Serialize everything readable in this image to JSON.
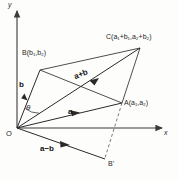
{
  "figure": {
    "background_color": "#fdfdfc",
    "stroke_color": "#3a3a3a",
    "axes": {
      "x_label": "x",
      "y_label": "y",
      "origin_label": "O"
    },
    "points": [
      {
        "id": "A",
        "label": "A(a",
        "sub1": "1",
        "mid": ",a",
        "sub2": "2",
        "tail": ")",
        "x": 122,
        "y": 103
      },
      {
        "id": "B",
        "label": "B(b",
        "sub1": "1",
        "mid": ",b",
        "sub2": "2",
        "tail": ")",
        "x": 40,
        "y": 70
      },
      {
        "id": "C",
        "label": "C(a",
        "sub1": "1",
        "mid": "+b",
        "sub2": "1",
        "tail": ")",
        "x": 140,
        "y": 48
      },
      {
        "id": "Bprime",
        "label": "B'",
        "x": 105,
        "y": 160
      }
    ],
    "point_labels": {
      "A": "A(a₁,a₂)",
      "B": "B(b₁,b₂)",
      "C": "C(a₁+b₁,a₂+b₂)",
      "Bprime": "B'"
    },
    "vectors": [
      {
        "name": "a",
        "label": "a",
        "from": "O",
        "to": "A",
        "style": "solid"
      },
      {
        "name": "b",
        "label": "b",
        "from": "O",
        "to": "B",
        "style": "solid"
      },
      {
        "name": "a+b",
        "label": "a+b",
        "from": "O",
        "to": "C",
        "style": "solid"
      },
      {
        "name": "a-b",
        "label": "a−b",
        "from": "O",
        "to": "Bprime",
        "style": "solid"
      }
    ],
    "angle": {
      "symbol": "θ",
      "between": [
        "a",
        "b"
      ]
    },
    "edges": [
      {
        "from": "B",
        "to": "C",
        "style": "solid"
      },
      {
        "from": "A",
        "to": "C",
        "style": "solid"
      },
      {
        "from": "B",
        "to": "A",
        "style": "solid"
      },
      {
        "from": "A",
        "to": "Bprime",
        "style": "dashed"
      },
      {
        "from": "Bprime",
        "to": "O",
        "style": "solid"
      }
    ]
  }
}
